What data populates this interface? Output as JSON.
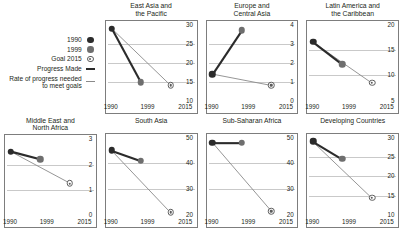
{
  "legend": {
    "items": [
      {
        "label": "1990",
        "marker": "filled-dark-circle-icon"
      },
      {
        "label": "1999",
        "marker": "filled-gray-circle-icon"
      },
      {
        "label": "Goal 2015",
        "marker": "bullseye-target-icon"
      },
      {
        "label": "Progress Made",
        "marker": "thick-dark-line-icon"
      },
      {
        "label": "Rate of progress needed to meet goals",
        "marker": "thin-gray-line-icon"
      }
    ]
  },
  "chart_data": {
    "type": "line",
    "title": "",
    "xlabel": "",
    "ylabel": "",
    "grid": true,
    "legend_position": "top-left",
    "x": [
      "1990",
      "1999",
      "2015"
    ],
    "series_names": [
      "Progress Made",
      "Rate of progress needed to meet goals"
    ],
    "panels": [
      {
        "title": "East Asia and the Pacific",
        "title_lines": [
          "East Asia and",
          "the Pacific"
        ],
        "ylim": [
          10,
          30
        ],
        "yticks": [
          10,
          15,
          20,
          25,
          30
        ],
        "values": {
          "1990": 29.0,
          "1999": 14.8,
          "goal_2015": 14.0
        }
      },
      {
        "title": "Europe and Central Asia",
        "title_lines": [
          "Europe and",
          "Central Asia"
        ],
        "ylim": [
          0,
          4
        ],
        "yticks": [
          0,
          1,
          2,
          3,
          4
        ],
        "values": {
          "1990": 1.4,
          "1999": 3.7,
          "goal_2015": 0.8
        }
      },
      {
        "title": "Latin America and the Caribbean",
        "title_lines": [
          "Latin America and",
          "the Caribbean"
        ],
        "ylim": [
          5,
          20
        ],
        "yticks": [
          5,
          10,
          15,
          20
        ],
        "values": {
          "1990": 16.6,
          "1999": 12.2,
          "goal_2015": 8.5
        }
      },
      {
        "title": "Middle East and North Africa",
        "title_lines": [
          "Middle East and",
          "North Africa"
        ],
        "ylim": [
          0,
          3
        ],
        "yticks": [
          0,
          1,
          2,
          3
        ],
        "values": {
          "1990": 2.5,
          "1999": 2.2,
          "goal_2015": 1.25
        }
      },
      {
        "title": "South Asia",
        "title_lines": [
          "South Asia"
        ],
        "ylim": [
          20,
          50
        ],
        "yticks": [
          20,
          30,
          40,
          50
        ],
        "values": {
          "1990": 45.0,
          "1999": 41.0,
          "goal_2015": 21.0
        }
      },
      {
        "title": "Sub-Saharan Africa",
        "title_lines": [
          "Sub-Saharan Africa"
        ],
        "ylim": [
          20,
          50
        ],
        "yticks": [
          20,
          30,
          40,
          50
        ],
        "values": {
          "1990": 48.0,
          "1999": 48.0,
          "goal_2015": 21.5
        }
      },
      {
        "title": "Developing Countries",
        "title_lines": [
          "Developing Countries"
        ],
        "ylim": [
          10,
          30
        ],
        "yticks": [
          10,
          15,
          20,
          25,
          30
        ],
        "values": {
          "1990": 29.0,
          "1999": 24.5,
          "goal_2015": 14.5
        }
      }
    ]
  },
  "colors": {
    "marker_1990": "#2b2b2b",
    "marker_1999": "#6e6e6e",
    "marker_goal": "#5c5c5c",
    "progress_line": "#2b2b2b",
    "needed_line": "#8a8a8a",
    "gridline": "#c9c9c9",
    "panel_border": "#7d7d7d",
    "text": "#231f20"
  }
}
